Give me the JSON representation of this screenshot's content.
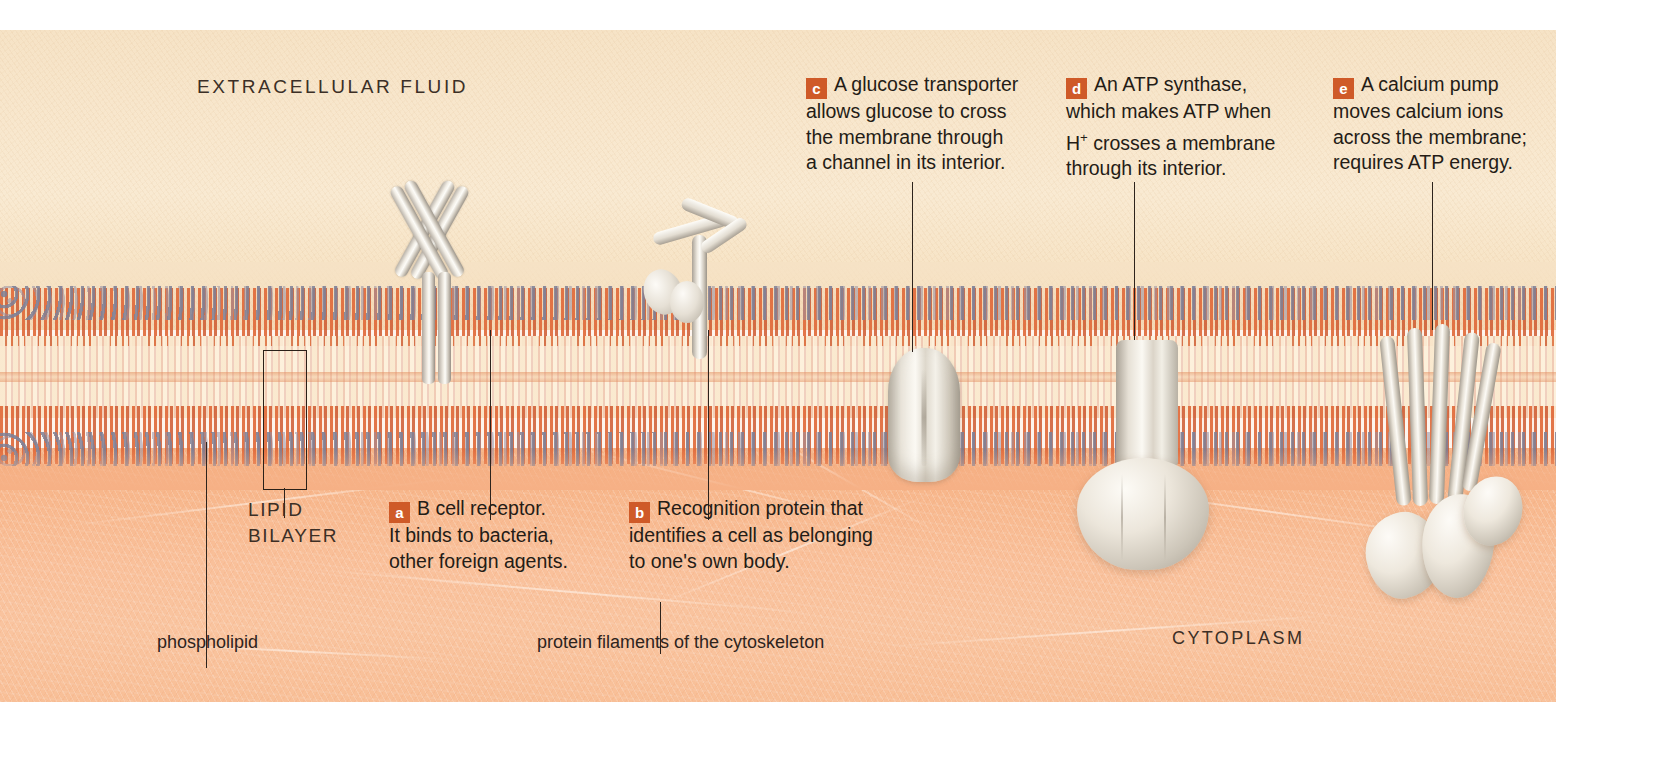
{
  "figure": {
    "accent_color": "#cf5a28",
    "extracellular_color": "#f7e6cc",
    "cytoplasm_color": "#f8bd95"
  },
  "region_labels": {
    "extracellular": "EXTRACELLULAR FLUID",
    "cytoplasm": "CYTOPLASM",
    "lipid_bilayer_line1": "LIPID",
    "lipid_bilayer_line2": "BILAYER"
  },
  "leader_labels": {
    "phospholipid": "phospholipid",
    "cytoskeleton": "protein filaments of the cytoskeleton"
  },
  "callouts": [
    {
      "key": "a",
      "badge": "a",
      "lines": [
        "B cell receptor.",
        "It binds to bacteria,",
        "other foreign agents."
      ]
    },
    {
      "key": "b",
      "badge": "b",
      "lines": [
        "Recognition protein that",
        "identifies a cell as belonging",
        "to one's own body."
      ]
    },
    {
      "key": "c",
      "badge": "c",
      "lines": [
        "A glucose transporter",
        "allows glucose to cross",
        "the membrane through",
        "a channel in its interior."
      ]
    },
    {
      "key": "d",
      "badge": "d",
      "lines": [
        "An ATP synthase,",
        "which makes ATP when",
        "H+ crosses a membrane",
        "through its interior."
      ],
      "line3_prefix": "H",
      "line3_sup": "+",
      "line3_suffix": " crosses a membrane"
    },
    {
      "key": "e",
      "badge": "e",
      "lines": [
        "A calcium pump",
        "moves calcium ions",
        "across the membrane;",
        "requires ATP energy."
      ]
    }
  ],
  "structures": {
    "b_cell_receptor": "b-cell-receptor-antibody",
    "recognition_protein": "recognition-glycoprotein",
    "glucose_transporter": "glucose-transporter-channel",
    "atp_synthase": "atp-synthase",
    "calcium_pump": "calcium-pump"
  }
}
